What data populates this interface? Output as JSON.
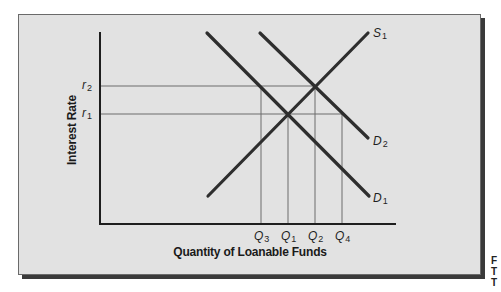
{
  "diagram": {
    "type": "supply-demand",
    "y_axis_label": "Interest Rate",
    "x_axis_label": "Quantity of Loanable Funds",
    "y_ticks": [
      {
        "letter": "r",
        "sub": "2"
      },
      {
        "letter": "r",
        "sub": "1"
      }
    ],
    "x_ticks": [
      {
        "letter": "Q",
        "sub": "3"
      },
      {
        "letter": "Q",
        "sub": "1"
      },
      {
        "letter": "Q",
        "sub": "2"
      },
      {
        "letter": "Q",
        "sub": "4"
      }
    ],
    "curves": [
      {
        "id": "S1",
        "letter": "S",
        "sub": "1",
        "kind": "supply"
      },
      {
        "id": "D2",
        "letter": "D",
        "sub": "2",
        "kind": "demand"
      },
      {
        "id": "D1",
        "letter": "D",
        "sub": "1",
        "kind": "demand"
      }
    ],
    "equilibria": [
      {
        "supply": "S1",
        "demand": "D1",
        "rate": "r1",
        "quantity": "Q1"
      },
      {
        "supply": "S1",
        "demand": "D2",
        "rate": "r2",
        "quantity": "Q2"
      }
    ],
    "colors": {
      "panel": "#e2e2e2",
      "curve": "#2e2e2e",
      "guide": "#6c6c6c",
      "shadow": "#3a3a3a"
    }
  },
  "side_text": [
    "F",
    "T",
    "T"
  ]
}
